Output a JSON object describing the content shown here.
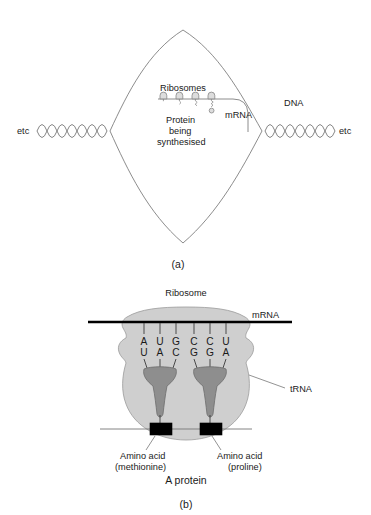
{
  "figure": {
    "title_a": "(a)",
    "title_b": "(b)",
    "background": "#ffffff",
    "ink": "#1a1a1a"
  },
  "panel_a": {
    "caption": "(a)",
    "labels": {
      "etc_left": "etc",
      "etc_right": "etc",
      "dna": "DNA",
      "mrna": "mRNA",
      "ribosomes": "Ribosomes",
      "protein_line1": "Protein",
      "protein_line2": "being",
      "protein_line3": "synthesised"
    },
    "ribosome_count": 4
  },
  "panel_b": {
    "caption": "(b)",
    "labels": {
      "ribosome": "Ribosome",
      "mrna": "mRNA",
      "trna": "tRNA",
      "amino_acid_1_line1": "Amino acid",
      "amino_acid_1_line2": "(methionine)",
      "amino_acid_2_line1": "Amino acid",
      "amino_acid_2_line2": "(proline)",
      "protein": "A protein"
    },
    "codon_row": [
      "A",
      "U",
      "G",
      "C",
      "C",
      "U"
    ],
    "anticodon_row": [
      "U",
      "A",
      "C",
      "G",
      "G",
      "A"
    ],
    "trna_count": 2,
    "amino_acid_count": 2
  },
  "colors": {
    "ribosome_fill": "#cfcfcf",
    "ribosome_stroke": "#9a9a9a",
    "trna_fill": "#8e8e8e",
    "trna_stroke": "#6d6d6d",
    "amino_acid_fill": "#000000",
    "line_gray": "#777777",
    "mrna_black": "#000000"
  }
}
